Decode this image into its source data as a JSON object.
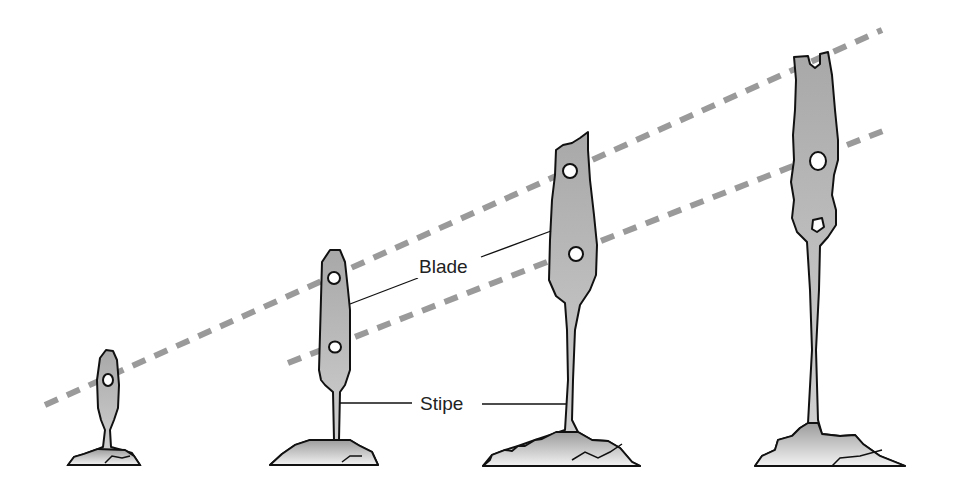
{
  "diagram": {
    "labels": {
      "blade": "Blade",
      "stipe": "Stipe"
    },
    "colors": {
      "fill": "#b8b8b8",
      "outline": "#111111",
      "dashed_line": "#9a9a9a",
      "background": "#ffffff"
    },
    "stages": [
      {
        "id": 1,
        "holes": 1
      },
      {
        "id": 2,
        "holes": 2
      },
      {
        "id": 3,
        "holes": 2
      },
      {
        "id": 4,
        "holes": 2,
        "notch": true
      }
    ]
  }
}
